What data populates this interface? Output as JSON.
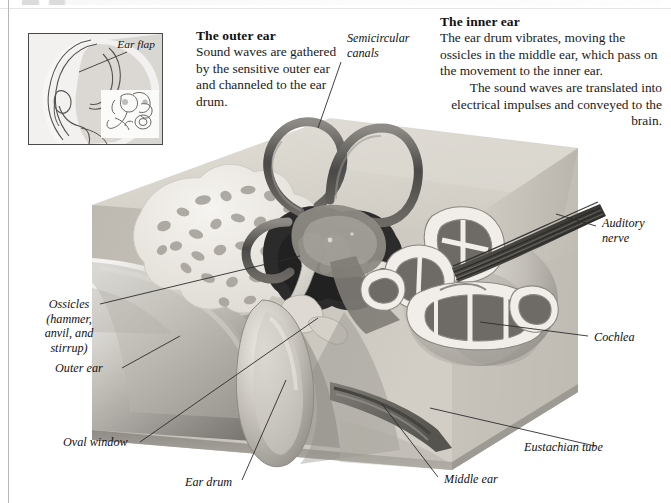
{
  "figure": {
    "type": "anatomical cutaway illustration"
  },
  "panels": {
    "outer_ear": {
      "heading": "The outer ear",
      "body": "Sound waves are gathered by the sensitive outer ear and channeled to the ear drum."
    },
    "inner_ear": {
      "heading": "The inner ear",
      "body_left": "The ear drum vibrates, moving the ossicles in the middle ear, which pass on the movement to the inner ear.",
      "body_right": "The sound waves are translated into electrical impulses and conveyed to the brain."
    }
  },
  "inset": {
    "label": "Ear flap",
    "description": "head profile with ear and inner ear detail"
  },
  "callouts": [
    {
      "id": "semicircular-canals",
      "label": "Semicircular\ncanals"
    },
    {
      "id": "auditory-nerve",
      "label": "Auditory\nnerve"
    },
    {
      "id": "cochlea",
      "label": "Cochlea"
    },
    {
      "id": "eustachian-tube",
      "label": "Eustachian tube"
    },
    {
      "id": "middle-ear",
      "label": "Middle ear"
    },
    {
      "id": "ear-drum",
      "label": "Ear drum"
    },
    {
      "id": "oval-window",
      "label": "Oval window"
    },
    {
      "id": "outer-ear",
      "label": "Outer ear"
    },
    {
      "id": "ossicles",
      "label": "Ossicles\n(hammer,\nanvil, and\nstirrup)"
    }
  ],
  "colors": {
    "page": "#ffffff",
    "ink": "#111111",
    "rule": "#b8b8b8",
    "block_top": "#d9d6cf",
    "block_face": "#c9c5bd",
    "canal_dark": "#4f4e4c",
    "tissue_mid": "#9a9792",
    "cavity_dark": "#2d2d2d",
    "bone_light": "#efece6",
    "nerve": "#5d5b58"
  }
}
